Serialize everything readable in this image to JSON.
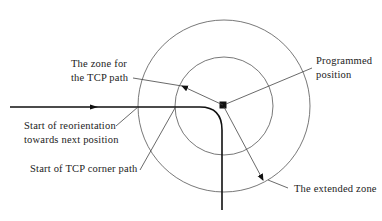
{
  "diagram": {
    "labels": {
      "zone_for_tcp_path_line1": "The zone for",
      "zone_for_tcp_path_line2": "the TCP path",
      "programmed_position_line1": "Programmed",
      "programmed_position_line2": "position",
      "start_reorientation_line1": "Start of reorientation",
      "start_reorientation_line2": "towards next position",
      "start_corner_path": "Start of TCP corner path",
      "extended_zone": "The extended zone"
    },
    "elements": {
      "inner_circle": "zone for the TCP path",
      "outer_circle": "extended zone",
      "center_marker": "programmed position",
      "path": "TCP path with corner"
    },
    "colors": {
      "line": "#111111",
      "circle": "#555555",
      "text": "#222222"
    }
  }
}
